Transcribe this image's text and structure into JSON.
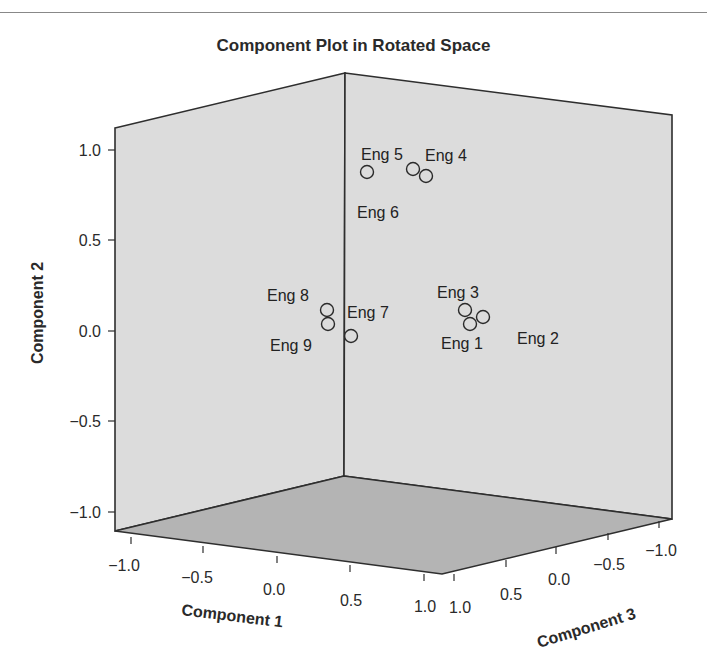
{
  "chart_data": {
    "type": "scatter",
    "subtype": "3d",
    "title": "Component Plot in Rotated Space",
    "xlabel": "Component 1",
    "ylabel": "Component 2",
    "zlabel": "Component 3",
    "xlim": [
      -1.0,
      1.0
    ],
    "ylim": [
      -1.0,
      1.0
    ],
    "zlim": [
      -1.0,
      1.0
    ],
    "x_ticks": [
      "-1.0",
      "-0.5",
      "0.0",
      "0.5",
      "1.0"
    ],
    "y_ticks": [
      "1.0",
      "0.5",
      "0.0",
      "-0.5",
      "-1.0"
    ],
    "z_ticks": [
      "1.0",
      "0.5",
      "0.0",
      "-0.5",
      "-1.0"
    ],
    "grid": false,
    "legend": null,
    "points": [
      {
        "label": "Eng 1",
        "component1": 0.1,
        "component2": 0.05,
        "component3": 0.9
      },
      {
        "label": "Eng 2",
        "component1": 0.05,
        "component2": 0.1,
        "component3": 0.88
      },
      {
        "label": "Eng 3",
        "component1": 0.08,
        "component2": 0.12,
        "component3": 0.85
      },
      {
        "label": "Eng 4",
        "component1": 0.1,
        "component2": 0.88,
        "component3": 0.05
      },
      {
        "label": "Eng 5",
        "component1": 0.05,
        "component2": 0.9,
        "component3": 0.1
      },
      {
        "label": "Eng 6",
        "component1": 0.12,
        "component2": 0.87,
        "component3": 0.08
      },
      {
        "label": "Eng 7",
        "component1": 0.85,
        "component2": 0.05,
        "component3": 0.1
      },
      {
        "label": "Eng 8",
        "component1": 0.88,
        "component2": 0.12,
        "component3": 0.05
      },
      {
        "label": "Eng 9",
        "component1": 0.9,
        "component2": 0.08,
        "component3": 0.08
      }
    ]
  },
  "render": {
    "colors": {
      "wall": "#dcdcdc",
      "floor": "#b4b4b4",
      "edge": "#2e2e2e",
      "background": "#ffffff"
    },
    "cube": {
      "back_top": [
        345,
        73
      ],
      "back_bottom": [
        344,
        476
      ],
      "left_top": [
        115,
        128
      ],
      "left_bottom": [
        115,
        531
      ],
      "right_top": [
        672,
        115
      ],
      "right_bottom": [
        672,
        519
      ],
      "front_floor": [
        442,
        574
      ]
    },
    "y_axis": [
      {
        "label": "1.0",
        "y": 150
      },
      {
        "label": "0.5",
        "y": 240
      },
      {
        "label": "0.0",
        "y": 331
      },
      {
        "label": "−0.5",
        "y": 421
      },
      {
        "label": "−1.0",
        "y": 512
      }
    ],
    "x_axis": [
      {
        "label": "−1.0",
        "tx": 131,
        "ty": 537,
        "lx": 124,
        "ly": 571
      },
      {
        "label": "−0.5",
        "tx": 203,
        "ty": 546,
        "lx": 197,
        "ly": 583
      },
      {
        "label": "0.0",
        "tx": 277,
        "ty": 556,
        "lx": 274,
        "ly": 595
      },
      {
        "label": "0.5",
        "tx": 350,
        "ty": 565,
        "lx": 351,
        "ly": 606
      },
      {
        "label": "1.0",
        "tx": 424,
        "ty": 574,
        "lx": 425,
        "ly": 612
      }
    ],
    "z_axis": [
      {
        "label": "1.0",
        "tx": 454,
        "ty": 574,
        "lx": 460,
        "ly": 613
      },
      {
        "label": "0.5",
        "tx": 506,
        "ty": 560,
        "lx": 511,
        "ly": 600
      },
      {
        "label": "0.0",
        "tx": 556,
        "ty": 547,
        "lx": 559,
        "ly": 585
      },
      {
        "label": "−0.5",
        "tx": 608,
        "ty": 533,
        "lx": 609,
        "ly": 570
      },
      {
        "label": "−1.0",
        "tx": 659,
        "ty": 521,
        "lx": 661,
        "ly": 556
      }
    ],
    "point_marks": [
      {
        "label": "Eng 1",
        "cx": 470,
        "cy": 324,
        "lx": 441,
        "ly": 349
      },
      {
        "label": "Eng 2",
        "cx": 483,
        "cy": 317,
        "lx": 517,
        "ly": 344
      },
      {
        "label": "Eng 3",
        "cx": 465,
        "cy": 310,
        "lx": 437,
        "ly": 298
      },
      {
        "label": "Eng 4",
        "cx": 426,
        "cy": 176,
        "lx": 425,
        "ly": 161
      },
      {
        "label": "Eng 5",
        "cx": 413,
        "cy": 169,
        "lx": 361,
        "ly": 160
      },
      {
        "label": "Eng 6",
        "cx": 367,
        "cy": 172,
        "lx": 357,
        "ly": 218
      },
      {
        "label": "Eng 7",
        "cx": 351,
        "cy": 336,
        "lx": 347,
        "ly": 318
      },
      {
        "label": "Eng 8",
        "cx": 327,
        "cy": 310,
        "lx": 267,
        "ly": 301
      },
      {
        "label": "Eng 9",
        "cx": 328,
        "cy": 324,
        "lx": 270,
        "ly": 351
      }
    ],
    "xlabel_pos": [
      181,
      615,
      7
    ],
    "zlabel_pos": [
      539,
      648,
      -17
    ],
    "ylabel_pos": [
      43,
      313
    ]
  }
}
